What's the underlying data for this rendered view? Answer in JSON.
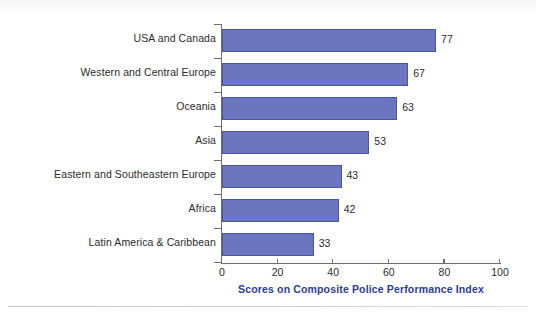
{
  "chart_data": {
    "type": "bar",
    "orientation": "horizontal",
    "title": "",
    "xlabel": "Scores on Composite Police Performance Index",
    "ylabel": "",
    "categories": [
      "USA and Canada",
      "Western and Central Europe",
      "Oceania",
      "Asia",
      "Eastern and Southeastern Europe",
      "Africa",
      "Latin America & Caribbean"
    ],
    "values": [
      77,
      67,
      63,
      53,
      43,
      42,
      33
    ],
    "value_labels": [
      "77",
      "67",
      "63",
      "53",
      "43",
      "42",
      "33"
    ],
    "xlim": [
      0,
      100
    ],
    "xticks": [
      0,
      20,
      40,
      60,
      80,
      100
    ],
    "xtick_labels": [
      "0",
      "20",
      "40",
      "60",
      "80",
      "100"
    ],
    "grid": false,
    "legend": false,
    "bar_color": "#6c76c0",
    "bar_border_color": "#4a54a2",
    "axis_title_color": "#2b3c9b",
    "axis_line_color": "#6f6f6f",
    "background_color": "#ffffff"
  }
}
